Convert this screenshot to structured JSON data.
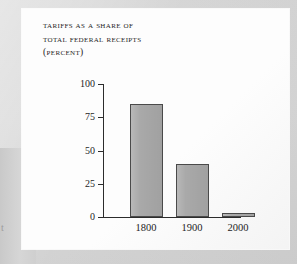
{
  "page": {
    "background_color": "#d2d2d2",
    "panel_color": "#fdfdfd",
    "margin_glyph": "t"
  },
  "chart_data": {
    "type": "bar",
    "title": "TARIFFS AS A SHARE OF TOTAL FEDERAL RECEIPTS (PERCENT)",
    "title_lines": [
      "Tariffs as a share of",
      "total federal receipts",
      "(percent)"
    ],
    "categories": [
      "1800",
      "1900",
      "2000"
    ],
    "values": [
      85,
      40,
      3
    ],
    "xlabel": "",
    "ylabel": "",
    "ylim": [
      0,
      100
    ],
    "yticks": [
      0,
      25,
      50,
      75,
      100
    ],
    "ytick_labels": [
      "0",
      "25",
      "50",
      "75",
      "100"
    ],
    "grid": false,
    "legend": false,
    "bar_color": "#a9a9a9",
    "bar_border_color": "#4a4a4a",
    "axis_color": "#2c2c2c"
  }
}
